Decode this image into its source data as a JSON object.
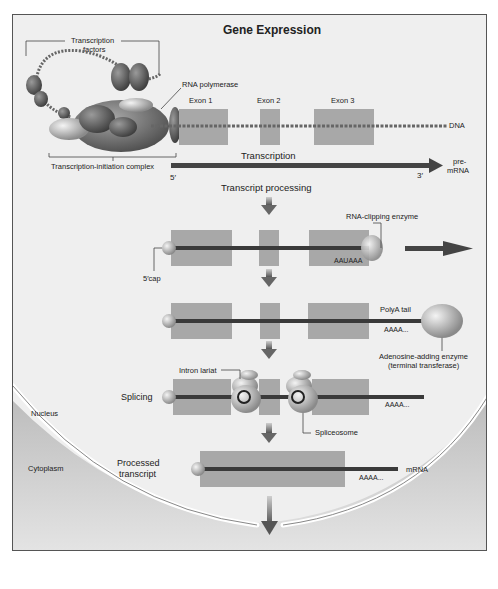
{
  "title": "Gene Expression",
  "top": {
    "transcription_factors_label_1": "Transcription",
    "transcription_factors_label_2": "factors",
    "rna_polymerase_label": "RNA polymerase",
    "initiation_complex_label": "Transcription-initiation complex",
    "exons": [
      "Exon 1",
      "Exon 2",
      "Exon 3"
    ],
    "dna_label": "DNA",
    "transcription_label": "Transcription",
    "five_prime": "5′",
    "three_prime": "3′",
    "premrna_label_1": "pre-",
    "premrna_label_2": "mRNA",
    "transcript_processing_label": "Transcript processing"
  },
  "steps": {
    "clipping": {
      "enzyme_label": "RNA-clipping enzyme",
      "signal_seq": "AAUAAA",
      "cap_label": "5′cap"
    },
    "polyA": {
      "tail_label": "PolyA tail",
      "seq": "AAAA...",
      "enzyme_label_1": "Adenosine-adding enzyme",
      "enzyme_label_2": "(terminal transferase)"
    },
    "splicing": {
      "label": "Splicing",
      "lariat_label": "Intron lariat",
      "spliceosome_label": "Spliceosome",
      "seq": "AAAA..."
    },
    "processed": {
      "label_1": "Processed",
      "label_2": "transcript",
      "seq": "AAAA...",
      "mrna_label": "mRNA"
    }
  },
  "compartments": {
    "nucleus": "Nucleus",
    "cytoplasm": "Cytoplasm"
  },
  "bottom_label": "Translation into protein",
  "colors": {
    "exon_box": "#a8a8a8",
    "strand": "#3a3a3a",
    "arrow": "#6e6e6e",
    "background": "#efefef",
    "cytoplasm": "#c9c9c9"
  }
}
